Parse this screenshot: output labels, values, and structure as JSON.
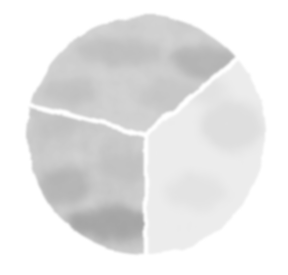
{
  "chart_data": {
    "type": "pie",
    "title": "",
    "subtitle": "",
    "xlabel": "",
    "ylabel": "",
    "legend": [],
    "annotations": [],
    "grid": false,
    "legend_position": "none",
    "style": "hand-drawn watercolor grayscale",
    "background_color": "#ffffff",
    "separator_color": "#ffffff",
    "separator_width_px": 4,
    "center_x": 146,
    "center_y": 135,
    "radius": 119,
    "start_angle_deg": -40,
    "direction": "clockwise",
    "categories": [
      "Slice 1",
      "Slice 2",
      "Slice 3"
    ],
    "values": [
      36.1,
      37.4,
      26.5
    ],
    "percentages": [
      "36.1%",
      "37.4%",
      "26.5%"
    ],
    "slices": [
      {
        "label": "Slice 1",
        "value": 36.1,
        "start_angle_deg": -40,
        "end_angle_deg": 90,
        "sweep_deg": 130,
        "color": "#ededed",
        "shade": "very light gray",
        "position": "right"
      },
      {
        "label": "Slice 2",
        "value": 37.4,
        "start_angle_deg": 90,
        "end_angle_deg": 194.5,
        "sweep_deg": 104.5,
        "color": "#d2d2d2",
        "shade": "medium light gray",
        "position": "bottom-left"
      },
      {
        "label": "Slice 3",
        "value": 26.5,
        "start_angle_deg": 194.5,
        "end_angle_deg": 320,
        "sweep_deg": 125.5,
        "color": "#d6d6d6",
        "shade": "medium light gray",
        "position": "top"
      }
    ],
    "palette": [
      "#ededed",
      "#d2d2d2",
      "#d6d6d6"
    ],
    "texture_dark_accent": "#9a9a9a",
    "texture_mid_accent": "#b8b8b8",
    "axis_ranges": null,
    "tick_labels": []
  },
  "figure": {
    "width": 288,
    "height": 275
  }
}
